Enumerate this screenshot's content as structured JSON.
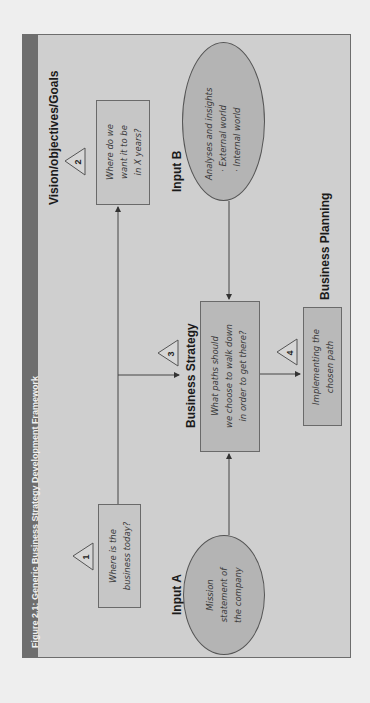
{
  "figure": {
    "caption": "Figure 2.1: Generic Business Strategy Development Framework",
    "orientation": "rotated 90° counter-clockwise",
    "colors": {
      "page_background": "#eeeeee",
      "figure_background": "#cfcfcf",
      "header_bar": "#6e6e6e",
      "box_fill": "#b9b9b9",
      "ellipse_fill": "#b4b4b4",
      "stroke": "#555555"
    }
  },
  "labels": {
    "vision": "Vision/objectives/Goals",
    "input_b": "Input B",
    "input_a": "Input A",
    "business_strategy": "Business Strategy",
    "business_planning": "Business Planning"
  },
  "steps": [
    {
      "number": "1",
      "line1": "Where is the",
      "line2": "business today?"
    },
    {
      "number": "2",
      "line1": "Where do we",
      "line2": "want it to be",
      "line3": "in X years?"
    },
    {
      "number": "3",
      "line1": "What paths should",
      "line2": "we choose to walk down",
      "line3": "in order to get there?"
    },
    {
      "number": "4",
      "line1": "Implementing the",
      "line2": "chosen path"
    }
  ],
  "inputs": {
    "a": {
      "line1": "Mission",
      "line2": "statement of",
      "line3": "the company"
    },
    "b": {
      "line1": "Analyses and insights",
      "line2": "· External world",
      "line3": "· Internal world"
    }
  },
  "connections": [
    {
      "from": "step-1",
      "to": "step-2",
      "type": "arrow"
    },
    {
      "from": "step-1",
      "to": "step-3",
      "type": "arrow"
    },
    {
      "from": "input-b",
      "to": "step-3",
      "type": "arrow"
    },
    {
      "from": "input-a",
      "to": "step-3",
      "type": "arrow"
    },
    {
      "from": "step-3",
      "to": "step-4",
      "type": "arrow"
    }
  ]
}
